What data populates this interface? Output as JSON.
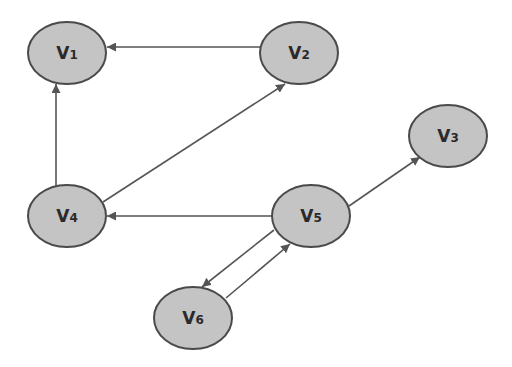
{
  "diagram": {
    "type": "directed-graph",
    "colors": {
      "node_fill": "#c4c4c4",
      "node_stroke": "#4a4a4a",
      "edge": "#555555",
      "text": "#2a2a2a"
    },
    "nodes": [
      {
        "id": "v1",
        "main": "V",
        "sub": "1",
        "cx": 67,
        "cy": 53
      },
      {
        "id": "v2",
        "main": "V",
        "sub": "2",
        "cx": 299,
        "cy": 53
      },
      {
        "id": "v3",
        "main": "V",
        "sub": "3",
        "cx": 448,
        "cy": 136
      },
      {
        "id": "v4",
        "main": "V",
        "sub": "4",
        "cx": 67,
        "cy": 216
      },
      {
        "id": "v5",
        "main": "V",
        "sub": "5",
        "cx": 311,
        "cy": 216
      },
      {
        "id": "v6",
        "main": "V",
        "sub": "6",
        "cx": 193,
        "cy": 318
      }
    ],
    "edges": [
      {
        "from": "v2",
        "to": "v1"
      },
      {
        "from": "v4",
        "to": "v1"
      },
      {
        "from": "v4",
        "to": "v2"
      },
      {
        "from": "v5",
        "to": "v4"
      },
      {
        "from": "v5",
        "to": "v3"
      },
      {
        "from": "v5",
        "to": "v6"
      },
      {
        "from": "v6",
        "to": "v5"
      }
    ]
  }
}
